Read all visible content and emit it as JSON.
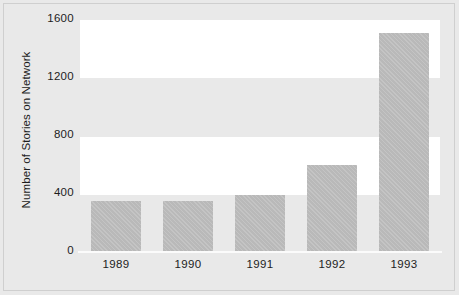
{
  "chart_data": {
    "type": "bar",
    "title": "",
    "xlabel": "",
    "ylabel": "Number of Stories on Network",
    "categories": [
      "1989",
      "1990",
      "1991",
      "1992",
      "1993"
    ],
    "values": [
      355,
      355,
      395,
      600,
      1510
    ],
    "ylim": [
      0,
      1600
    ],
    "yticks": [
      0,
      400,
      800,
      1200,
      1600
    ],
    "ytick_labels": [
      "0",
      "400",
      "800",
      "1200",
      "1600"
    ],
    "grid": false,
    "legend": null,
    "series": [
      {
        "name": "Number of Stories on Network",
        "values": [
          355,
          355,
          395,
          600,
          1510
        ]
      }
    ],
    "bands": [
      {
        "name": "band-1600-1200",
        "shade": "white"
      },
      {
        "name": "band-1200-800",
        "shade": "gray"
      },
      {
        "name": "band-800-400",
        "shade": "white"
      },
      {
        "name": "band-400-0",
        "shade": "gray"
      }
    ],
    "colors": {
      "bar_fill": "#b9b9b9",
      "page_background": "#e9e9e9",
      "band_light": "#ffffff",
      "band_shaded": "#e9e9e9",
      "axis_line": "#fbfbfb",
      "text": "#1d1d1d",
      "frame_border": "#cfcfcf"
    }
  }
}
